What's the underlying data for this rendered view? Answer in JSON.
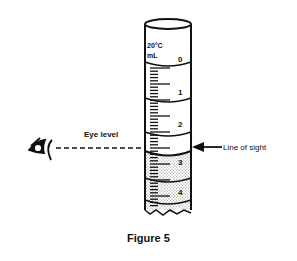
{
  "figure": {
    "caption": "Figure 5",
    "labels": {
      "eye_level": "Eye level",
      "line_of_sight": "Line of sight",
      "calibration_temp": "20°C",
      "unit": "mL"
    },
    "scale_numbers": [
      "0",
      "1",
      "2",
      "3",
      "4"
    ],
    "icons": {
      "eye": "eye-icon",
      "arrow": "arrow-left-icon"
    },
    "colors": {
      "ink": "#111111",
      "liquid": "#bdbdbd",
      "background": "#ffffff"
    }
  }
}
